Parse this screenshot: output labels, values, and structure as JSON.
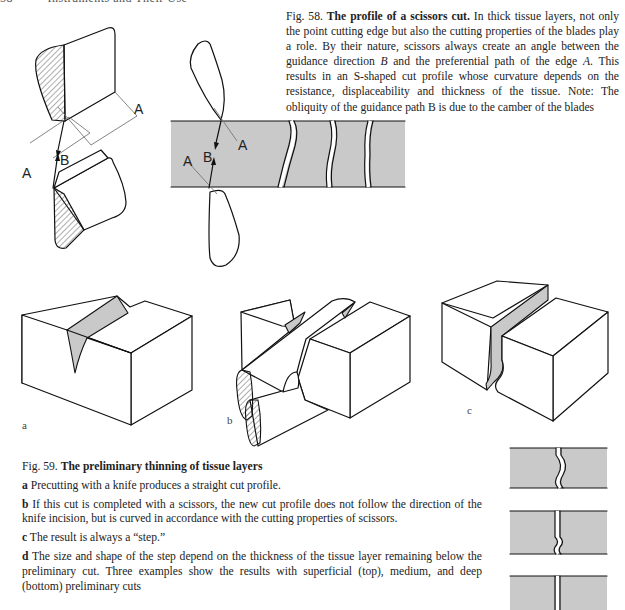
{
  "header": {
    "page_number": "58",
    "running_title": "Instruments and Their Use"
  },
  "fig58": {
    "label": "Fig. 58.",
    "title": "The profile of a scissors cut.",
    "text_1": " In thick tissue layers, not only the point cutting edge but also the cutting properties of the blades play a role. By their nature, scissors always create an angle between the guidance direction ",
    "var_b": "B",
    "text_2": " and the preferential path of the edge ",
    "var_a": "A",
    "text_3": ". This results in an S-shaped cut profile whose curvature depends on the resistance, displace­ability and thickness of the tissue. Note: The obliquity of the guidance path B is due to the camber of the blades",
    "diagram_labels": {
      "a_upper": "A",
      "a_lower": "A",
      "b": "B"
    }
  },
  "fig59": {
    "label": "Fig. 59.",
    "title": "The preliminary thinning of tissue layers",
    "panel_labels": [
      "a",
      "b",
      "c"
    ],
    "items": [
      {
        "key": "a",
        "text": " Precutting with a knife produces a straight cut profile."
      },
      {
        "key": "b",
        "text": " If this cut is completed with a scissors, the new cut profile does not follow the direction of the knife incision, but is curved in accordance with the cutting properties of scissors."
      },
      {
        "key": "c",
        "text": " The result is always a “step.”"
      },
      {
        "key": "d",
        "text": " The size and shape of the step depend on the thickness of the tissue layer remaining below the preliminary cut. Three examples show the results with superficial (top), medium, and deep (bottom) preliminary cuts"
      }
    ]
  },
  "colors": {
    "tissue_gray": "#c9c9c9",
    "line": "#111111",
    "paper": "#ffffff"
  }
}
